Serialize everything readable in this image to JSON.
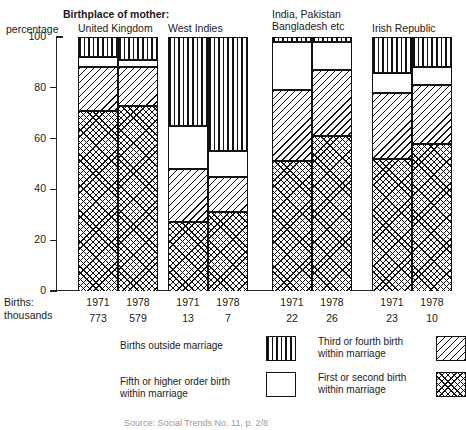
{
  "chart_data": {
    "type": "bar",
    "title": "Birthplace of mother:",
    "subtype": "stacked-percentage",
    "ylabel": "percentage",
    "xlabel": "",
    "ylim": [
      0,
      100
    ],
    "yticks": [
      0,
      20,
      40,
      60,
      80,
      100
    ],
    "grid": false,
    "legend_position": "bottom",
    "categories": [
      "United Kingdom 1971",
      "United Kingdom 1978",
      "West Indies 1971",
      "West Indies 1978",
      "India, Pakistan Bangladesh etc 1971",
      "India, Pakistan Bangladesh etc 1978",
      "Irish Republic 1971",
      "Irish Republic 1978"
    ],
    "series": [
      {
        "name": "Births outside marriage",
        "pattern": "vertical-stripes",
        "values": [
          8,
          9,
          35,
          45,
          2,
          2,
          14,
          12
        ]
      },
      {
        "name": "Fifth or higher order birth within marriage",
        "pattern": "plain-white",
        "values": [
          4,
          3,
          17,
          10,
          19,
          11,
          8,
          7
        ]
      },
      {
        "name": "Third or fourth birth within marriage",
        "pattern": "diagonal-hatch",
        "values": [
          17,
          15,
          21,
          14,
          28,
          26,
          26,
          23
        ]
      },
      {
        "name": "First or second birth within marriage",
        "pattern": "cross-hatch",
        "values": [
          71,
          73,
          27,
          31,
          51,
          61,
          52,
          58
        ]
      }
    ],
    "annotations": {
      "births_label": "Births:\nthousands",
      "births_thousands": [
        773,
        579,
        13,
        7,
        22,
        26,
        23,
        10
      ]
    }
  },
  "axis": {
    "y_label": "percentage",
    "ticks": [
      "100",
      "80",
      "60",
      "40",
      "20",
      "0"
    ]
  },
  "header": {
    "birthplace_caption": "Birthplace of mother:"
  },
  "groups": [
    {
      "title_line1": "United Kingdom",
      "title_line2": "",
      "years": [
        "1971",
        "1978"
      ],
      "births": [
        "773",
        "579"
      ]
    },
    {
      "title_line1": "West Indies",
      "title_line2": "",
      "years": [
        "1971",
        "1978"
      ],
      "births": [
        "13",
        "7"
      ]
    },
    {
      "title_line1": "India, Pakistan",
      "title_line2": "Bangladesh etc",
      "years": [
        "1971",
        "1978"
      ],
      "births": [
        "22",
        "26"
      ]
    },
    {
      "title_line1": "Irish Republic",
      "title_line2": "",
      "years": [
        "1971",
        "1978"
      ],
      "births": [
        "23",
        "10"
      ]
    }
  ],
  "births_axis": {
    "line1": "Births:",
    "line2": "thousands"
  },
  "legend": {
    "items": [
      {
        "line1": "Births outside marriage",
        "line2": "",
        "pattern": "vertical-stripes"
      },
      {
        "line1": "Third or fourth birth",
        "line2": "within marriage",
        "pattern": "diagonal-hatch"
      },
      {
        "line1": "Fifth or higher order birth",
        "line2": "within marriage",
        "pattern": "plain-white"
      },
      {
        "line1": "First or second birth",
        "line2": "within marriage",
        "pattern": "cross-hatch"
      }
    ]
  },
  "footer": {
    "source": "Source: Social Trends No. 11, p. 2/8"
  }
}
